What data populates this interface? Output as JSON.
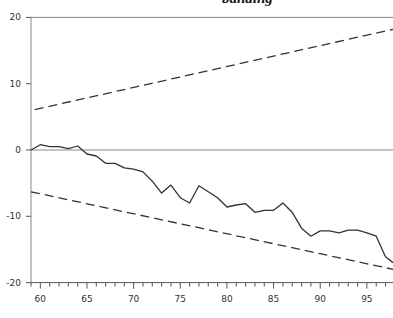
{
  "chart_data": {
    "type": "line",
    "title": "banding",
    "xlabel": "",
    "ylabel": "",
    "xlim": [
      59,
      97.8
    ],
    "ylim": [
      -20,
      20
    ],
    "x_ticks": [
      "60",
      "65",
      "70",
      "75",
      "80",
      "85",
      "90",
      "95"
    ],
    "y_ticks": [
      "20",
      "10",
      "0",
      "-10",
      "-20"
    ],
    "grid": false,
    "reference_lines": [
      {
        "type": "horizontal",
        "y": 0
      },
      {
        "type": "horizontal",
        "y": 20
      }
    ],
    "series": [
      {
        "name": "main",
        "style": "solid",
        "x": [
          59,
          60,
          61,
          62,
          63,
          64,
          65,
          66,
          67,
          68,
          69,
          70,
          71,
          72,
          73,
          74,
          75,
          76,
          77,
          78,
          79,
          80,
          81,
          82,
          83,
          84,
          85,
          86,
          87,
          88,
          89,
          90,
          91,
          92,
          93,
          94,
          95,
          96,
          97,
          97.8
        ],
        "values": [
          0,
          0.8,
          0.5,
          0.5,
          0.2,
          0.6,
          -0.6,
          -0.9,
          -2,
          -2,
          -2.7,
          -2.9,
          -3.3,
          -4.7,
          -6.5,
          -5.3,
          -7.2,
          -8,
          -5.4,
          -6.3,
          -7.2,
          -8.6,
          -8.3,
          -8.1,
          -9.4,
          -9.1,
          -9.1,
          -8,
          -9.4,
          -11.8,
          -13,
          -12.2,
          -12.2,
          -12.5,
          -12.1,
          -12.1,
          -12.5,
          -13,
          -16.1,
          -17
        ]
      },
      {
        "name": "upper band",
        "style": "dashed",
        "x": [
          59.4,
          97.8
        ],
        "values": [
          6.1,
          18.2
        ]
      },
      {
        "name": "lower band",
        "style": "dashed",
        "x": [
          59,
          97.8
        ],
        "values": [
          -6.3,
          -18
        ]
      }
    ]
  }
}
